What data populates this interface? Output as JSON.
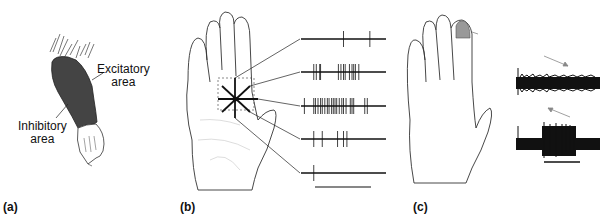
{
  "panels": [
    {
      "id": "a",
      "label": "(a)",
      "annotations": {
        "excitatory": "Excitatory area",
        "excitatory_line1": "Excitatory",
        "excitatory_line2": "area",
        "inhibitory_line1": "Inhibitory",
        "inhibitory_line2": "area"
      },
      "colors": {
        "excitatory_fill": "#444444"
      }
    },
    {
      "id": "b",
      "label": "(b)",
      "spike_trains": [
        {
          "direction": "up-right",
          "spikes": [
            0.5,
            0.81
          ]
        },
        {
          "direction": "right-up",
          "spikes": [
            0.15,
            0.18,
            0.22,
            0.23,
            0.44,
            0.47,
            0.5,
            0.52,
            0.57,
            0.6,
            0.62,
            0.64,
            0.68
          ]
        },
        {
          "direction": "right",
          "spikes": [
            0.04,
            0.15,
            0.17,
            0.2,
            0.23,
            0.25,
            0.28,
            0.31,
            0.33,
            0.36,
            0.38,
            0.4,
            0.42,
            0.45,
            0.48,
            0.5,
            0.53,
            0.58,
            0.6,
            0.62,
            0.75,
            0.78
          ]
        },
        {
          "direction": "right-down",
          "spikes": [
            0.15,
            0.25,
            0.43,
            0.5,
            0.54
          ]
        },
        {
          "direction": "down-right",
          "spikes": [
            0.15
          ]
        }
      ],
      "scale_bar": true
    },
    {
      "id": "c",
      "label": "(c)",
      "colors": {
        "receptive_field_fill": "#999999"
      },
      "traces": [
        {
          "direction": "distal-to-proximal",
          "response": "none"
        },
        {
          "direction": "proximal-to-distal",
          "response": "burst"
        }
      ],
      "scale_bar": true
    }
  ]
}
